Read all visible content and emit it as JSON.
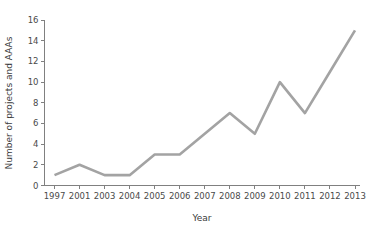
{
  "chart_data": {
    "type": "line",
    "title": "",
    "subtitle": "",
    "xlabel": "Year",
    "ylabel": "Number of projects and AAAs",
    "categories": [
      "1997",
      "2001",
      "2003",
      "2004",
      "2005",
      "2006",
      "2007",
      "2008",
      "2009",
      "2010",
      "2011",
      "2012",
      "2013"
    ],
    "values": [
      1,
      2,
      1,
      1,
      3,
      3,
      5,
      7,
      5,
      10,
      7,
      11,
      15
    ],
    "series": [
      {
        "name": "Number of projects and AAAs",
        "values": [
          1,
          2,
          1,
          1,
          3,
          3,
          5,
          7,
          5,
          10,
          7,
          11,
          15
        ],
        "color": "#a3a3a3"
      }
    ],
    "ylim": [
      0,
      16
    ],
    "yticks": [
      0,
      2,
      4,
      6,
      8,
      10,
      12,
      14,
      16
    ],
    "ytick_labels": [
      "0",
      "2",
      "4",
      "6",
      "8",
      "10",
      "12",
      "14",
      "16"
    ],
    "xtick_labels": [
      "1997",
      "2001",
      "2003",
      "2004",
      "2005",
      "2006",
      "2007",
      "2008",
      "2009",
      "2010",
      "2011",
      "2012",
      "2013"
    ],
    "grid": false,
    "legend": false,
    "legend_position": "none",
    "annotations": [],
    "line_color": "#a3a3a3",
    "axis_color": "#808080",
    "text_color": "#4a4a4a",
    "background": "#ffffff"
  }
}
